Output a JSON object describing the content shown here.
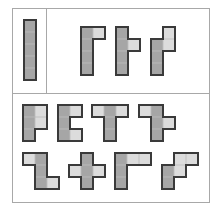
{
  "colors": {
    "dark": "#a6a6a6",
    "light": "#dcdcdc",
    "border": "#3a3a3a",
    "frame": "#a8a8a8"
  },
  "cell_size": 12,
  "panels": {
    "top_left": {
      "label": "reference-piece"
    },
    "top_right": {
      "label": "reference-shapes"
    },
    "bottom": {
      "label": "answer-options"
    }
  },
  "shapes": [
    {
      "id": "reference-bar",
      "x": 24,
      "y": 20,
      "cells": [
        [
          0,
          0,
          "d"
        ],
        [
          0,
          1,
          "d"
        ],
        [
          0,
          2,
          "d"
        ],
        [
          0,
          3,
          "d"
        ],
        [
          0,
          4,
          "d"
        ]
      ]
    },
    {
      "id": "top-shape-1",
      "x": 81,
      "y": 27,
      "cells": [
        [
          0,
          0,
          "d"
        ],
        [
          0,
          1,
          "d"
        ],
        [
          0,
          2,
          "d"
        ],
        [
          0,
          3,
          "d"
        ],
        [
          1,
          0,
          "l"
        ]
      ]
    },
    {
      "id": "top-shape-2",
      "x": 116,
      "y": 27,
      "cells": [
        [
          0,
          0,
          "d"
        ],
        [
          0,
          1,
          "d"
        ],
        [
          0,
          2,
          "d"
        ],
        [
          0,
          3,
          "d"
        ],
        [
          1,
          1,
          "l"
        ]
      ]
    },
    {
      "id": "top-shape-3",
      "x": 151,
      "y": 27,
      "cells": [
        [
          0,
          1,
          "d"
        ],
        [
          0,
          2,
          "d"
        ],
        [
          0,
          3,
          "d"
        ],
        [
          1,
          0,
          "l"
        ],
        [
          1,
          1,
          "l"
        ]
      ]
    },
    {
      "id": "option-1",
      "x": 23,
      "y": 105,
      "cells": [
        [
          0,
          0,
          "d"
        ],
        [
          0,
          1,
          "d"
        ],
        [
          0,
          2,
          "d"
        ],
        [
          1,
          0,
          "l"
        ],
        [
          1,
          1,
          "l"
        ]
      ]
    },
    {
      "id": "option-2",
      "x": 58,
      "y": 105,
      "cells": [
        [
          0,
          0,
          "d"
        ],
        [
          0,
          1,
          "d"
        ],
        [
          0,
          2,
          "d"
        ],
        [
          1,
          0,
          "l"
        ],
        [
          1,
          2,
          "l"
        ]
      ]
    },
    {
      "id": "option-3",
      "x": 92,
      "y": 105,
      "cells": [
        [
          0,
          0,
          "l"
        ],
        [
          1,
          0,
          "d"
        ],
        [
          2,
          0,
          "l"
        ],
        [
          1,
          1,
          "d"
        ],
        [
          1,
          2,
          "d"
        ]
      ]
    },
    {
      "id": "option-4",
      "x": 139,
      "y": 105,
      "cells": [
        [
          0,
          0,
          "l"
        ],
        [
          1,
          0,
          "d"
        ],
        [
          1,
          1,
          "d"
        ],
        [
          2,
          1,
          "l"
        ],
        [
          1,
          2,
          "d"
        ]
      ]
    },
    {
      "id": "option-5",
      "x": 23,
      "y": 153,
      "cells": [
        [
          0,
          0,
          "l"
        ],
        [
          1,
          0,
          "d"
        ],
        [
          1,
          1,
          "d"
        ],
        [
          1,
          2,
          "d"
        ],
        [
          2,
          2,
          "l"
        ]
      ]
    },
    {
      "id": "option-6",
      "x": 69,
      "y": 153,
      "cells": [
        [
          1,
          0,
          "d"
        ],
        [
          0,
          1,
          "l"
        ],
        [
          1,
          1,
          "d"
        ],
        [
          2,
          1,
          "l"
        ],
        [
          1,
          2,
          "d"
        ]
      ]
    },
    {
      "id": "option-7",
      "x": 115,
      "y": 153,
      "cells": [
        [
          0,
          0,
          "d"
        ],
        [
          1,
          0,
          "l"
        ],
        [
          2,
          0,
          "l"
        ],
        [
          0,
          1,
          "d"
        ],
        [
          0,
          2,
          "d"
        ]
      ]
    },
    {
      "id": "option-8",
      "x": 162,
      "y": 153,
      "cells": [
        [
          1,
          0,
          "l"
        ],
        [
          2,
          0,
          "l"
        ],
        [
          1,
          1,
          "l"
        ],
        [
          0,
          1,
          "d"
        ],
        [
          0,
          2,
          "d"
        ]
      ]
    }
  ]
}
